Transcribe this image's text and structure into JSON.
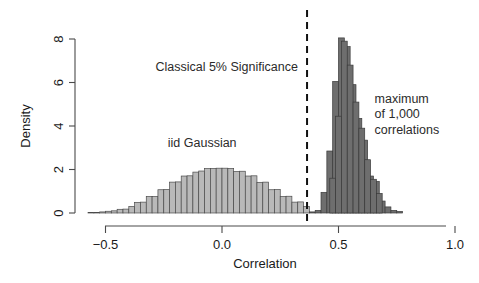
{
  "chart_data": {
    "type": "bar",
    "title": "",
    "subtitle": "",
    "xlabel": "Correlation",
    "ylabel": "Density",
    "xlim": [
      -0.62,
      1.02
    ],
    "ylim": [
      0,
      8.35
    ],
    "grid": false,
    "legend": "none",
    "xticks": [
      -0.5,
      0.0,
      0.5,
      1.0
    ],
    "xticklabels": [
      "-0.5",
      "0.0",
      "0.5",
      "1.0"
    ],
    "yticks": [
      0,
      2,
      4,
      6,
      8
    ],
    "yticklabels": [
      "0",
      "2",
      "4",
      "6",
      "8"
    ],
    "bin_width": 0.025,
    "annotations": [
      {
        "name": "significance-label",
        "text": "Classical 5% Significance",
        "x": 0.02,
        "y": 6.55,
        "anchor": "middle"
      },
      {
        "name": "iid-gaussian-label",
        "text": "iid Gaussian",
        "x": -0.085,
        "y": 3.05,
        "anchor": "middle"
      },
      {
        "name": "maximum-label-line1",
        "text": "maximum",
        "x": 0.655,
        "y": 5.05,
        "anchor": "start"
      },
      {
        "name": "maximum-label-line2",
        "text": "of 1,000",
        "x": 0.655,
        "y": 4.35,
        "anchor": "start"
      },
      {
        "name": "maximum-label-line3",
        "text": "correlations",
        "x": 0.655,
        "y": 3.65,
        "anchor": "start"
      }
    ],
    "threshold_line": {
      "name": "classical-5pct-threshold",
      "x": 0.365,
      "style": "dashed",
      "color": "#111111"
    },
    "series": [
      {
        "name": "iid Gaussian",
        "color": "#b9b9b9",
        "edge_color": "#4a4a4a",
        "bin_starts": [
          -0.575,
          -0.55,
          -0.525,
          -0.5,
          -0.475,
          -0.45,
          -0.425,
          -0.4,
          -0.375,
          -0.35,
          -0.325,
          -0.3,
          -0.275,
          -0.25,
          -0.225,
          -0.2,
          -0.175,
          -0.15,
          -0.125,
          -0.1,
          -0.075,
          -0.05,
          -0.025,
          0.0,
          0.025,
          0.05,
          0.075,
          0.1,
          0.125,
          0.15,
          0.175,
          0.2,
          0.225,
          0.25,
          0.275,
          0.3,
          0.325,
          0.35
        ],
        "values": [
          0.02,
          0.03,
          0.05,
          0.08,
          0.1,
          0.17,
          0.18,
          0.3,
          0.49,
          0.5,
          0.76,
          0.76,
          1.07,
          1.08,
          1.42,
          1.43,
          1.7,
          1.71,
          1.88,
          1.93,
          2.04,
          2.05,
          2.06,
          2.06,
          2.05,
          1.91,
          1.92,
          1.7,
          1.71,
          1.41,
          1.42,
          1.07,
          1.08,
          0.76,
          0.77,
          0.5,
          0.51,
          0.3
        ]
      },
      {
        "name": "maximum of 1,000 correlations",
        "color": "#6e6e6e",
        "edge_color": "#3a3a3a",
        "bin_starts": [
          0.375,
          0.4,
          0.425,
          0.45,
          0.475,
          0.5,
          0.525,
          0.55,
          0.575,
          0.6,
          0.625,
          0.65,
          0.675,
          0.7,
          0.725,
          0.75
        ],
        "values": [
          0.05,
          0.12,
          0.95,
          2.85,
          6.05,
          8.05,
          7.65,
          5.9,
          4.35,
          3.35,
          1.7,
          1.45,
          0.55,
          0.28,
          0.12,
          0.07
        ]
      },
      {
        "name": "maximum detail bins",
        "color": "#6e6e6e",
        "edge_color": "#3a3a3a",
        "bin_starts": [
          0.4625,
          0.4875,
          0.5125,
          0.5375,
          0.5625,
          0.5875,
          0.6125,
          0.6375,
          0.6625
        ],
        "values": [
          1.6,
          4.45,
          7.9,
          6.8,
          5.1,
          3.9,
          2.45,
          1.55,
          0.9
        ]
      }
    ]
  },
  "geometry": {
    "note": "pixel mapping of axes in the rendered 479x283 figure",
    "x_px": {
      "-0.5": 105,
      "0.0": 222,
      "0.5": 338,
      "1.0": 446
    },
    "y_px": {
      "0": 213,
      "2": 179.5,
      "4": 136,
      "6": 85,
      "8": 39
    }
  }
}
